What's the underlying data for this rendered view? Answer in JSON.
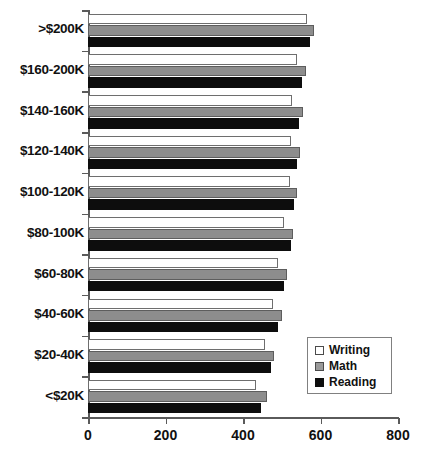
{
  "chart_data": {
    "type": "bar",
    "orientation": "horizontal",
    "title": "",
    "xlabel": "",
    "ylabel": "",
    "xlim": [
      0,
      800
    ],
    "xticks": [
      0,
      200,
      400,
      600,
      800
    ],
    "xtick_labels": [
      "0",
      "200",
      "400",
      "600",
      "800"
    ],
    "grid": false,
    "legend_position": "bottom-right",
    "categories": [
      ">$200K",
      "$160-200K",
      "$140-160K",
      "$120-140K",
      "$100-120K",
      "$80-100K",
      "$60-80K",
      "$40-60K",
      "$20-40K",
      "<$20K"
    ],
    "series": [
      {
        "name": "Writing",
        "color": "#ffffff",
        "values": [
          565,
          540,
          527,
          524,
          521,
          506,
          491,
          478,
          457,
          433
        ]
      },
      {
        "name": "Math",
        "color": "#8d8d8d",
        "values": [
          583,
          562,
          555,
          547,
          540,
          529,
          514,
          500,
          480,
          462
        ]
      },
      {
        "name": "Reading",
        "color": "#0d0d0d",
        "values": [
          573,
          552,
          545,
          539,
          532,
          524,
          506,
          491,
          472,
          446
        ]
      }
    ]
  },
  "legend": {
    "items": [
      {
        "label": "Writing",
        "swatch": "writing-swatch"
      },
      {
        "label": "Math",
        "swatch": "math-swatch"
      },
      {
        "label": "Reading",
        "swatch": "reading-swatch"
      }
    ]
  },
  "axis": {
    "x_tick_labels": [
      "0",
      "200",
      "400",
      "600",
      "800"
    ],
    "y_tick_labels": [
      ">$200K",
      "$160-200K",
      "$140-160K",
      "$120-140K",
      "$100-120K",
      "$80-100K",
      "$60-80K",
      "$40-60K",
      "$20-40K",
      "<$20K"
    ]
  },
  "colors": {
    "writing": "#ffffff",
    "math": "#8d8d8d",
    "reading": "#0d0d0d",
    "axis": "#5a5a5a",
    "text": "#111111",
    "background": "#ffffff"
  }
}
